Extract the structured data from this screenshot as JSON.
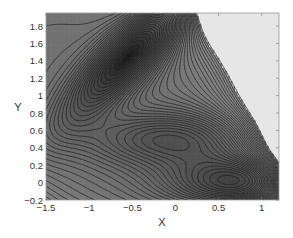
{
  "chart_data": {
    "type": "contour",
    "title": "",
    "xlabel": "X",
    "ylabel": "Y",
    "xlim": [
      -1.5,
      1.2
    ],
    "ylim": [
      -0.2,
      1.95
    ],
    "xticks": [
      -1.5,
      -1,
      -0.5,
      0,
      0.5,
      1
    ],
    "xtick_labels": [
      "−1.5",
      "−1",
      "−0.5",
      "0",
      "0.5",
      "1"
    ],
    "yticks": [
      -0.2,
      0,
      0.2,
      0.4,
      0.6,
      0.8,
      1,
      1.2,
      1.4,
      1.6,
      1.8
    ],
    "ytick_labels": [
      "−0.2",
      "0",
      "0.2",
      "0.4",
      "0.6",
      "0.8",
      "1",
      "1.2",
      "1.4",
      "1.6",
      "1.8"
    ],
    "grid": false,
    "legend": null,
    "surface": "Muller-Brown potential",
    "minima": [
      {
        "x": -0.56,
        "y": 1.44
      },
      {
        "x": -0.05,
        "y": 0.47
      },
      {
        "x": 0.62,
        "y": 0.03
      }
    ],
    "contour_levels": {
      "min": -146,
      "max": 120,
      "step": 7
    },
    "colors": {
      "low": "#1a1a1a",
      "high": "#8c8c8c",
      "clipped": "#e6e6e6",
      "line": "#1c1c1c",
      "frame": "#9a9a9a"
    }
  }
}
